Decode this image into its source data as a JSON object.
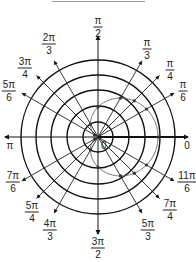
{
  "diagram": {
    "type": "polar-graph",
    "center": [
      98,
      137
    ],
    "ring_radii": [
      15,
      31,
      47,
      62,
      77
    ],
    "curve": {
      "kind": "cardioid",
      "equation_form": "r = a(1 + cos θ)",
      "a_px": 30,
      "color": "#555555"
    },
    "plotted_points_angles": [
      "0",
      "π/6",
      "π/4",
      "π/3",
      "π/2",
      "2π/3",
      "5π/6",
      "7π/6",
      "4π/3",
      "3π/2",
      "5π/3",
      "7π/4",
      "11π/6"
    ],
    "angle_labels": [
      {
        "id": "0",
        "text": "0",
        "x": 187,
        "y": 146
      },
      {
        "id": "pi6",
        "num": "π",
        "den": "6",
        "x": 183,
        "y": 91
      },
      {
        "id": "pi4",
        "num": "π",
        "den": "4",
        "x": 170,
        "y": 70
      },
      {
        "id": "pi3",
        "num": "π",
        "den": "3",
        "x": 147,
        "y": 49
      },
      {
        "id": "pi2",
        "num": "π",
        "den": "2",
        "x": 98,
        "y": 27
      },
      {
        "id": "2pi3",
        "num": "2π",
        "den": "3",
        "x": 49,
        "y": 44
      },
      {
        "id": "3pi4",
        "num": "3π",
        "den": "4",
        "x": 25,
        "y": 68
      },
      {
        "id": "5pi6",
        "num": "5π",
        "den": "6",
        "x": 9,
        "y": 91
      },
      {
        "id": "pi",
        "text": "π",
        "x": 10,
        "y": 146
      },
      {
        "id": "7pi6",
        "num": "7π",
        "den": "6",
        "x": 13,
        "y": 182
      },
      {
        "id": "5pi4",
        "num": "5π",
        "den": "4",
        "x": 32,
        "y": 212
      },
      {
        "id": "4pi3",
        "num": "4π",
        "den": "3",
        "x": 50,
        "y": 230
      },
      {
        "id": "3pi2",
        "num": "3π",
        "den": "2",
        "x": 98,
        "y": 248
      },
      {
        "id": "5pi3",
        "num": "5π",
        "den": "3",
        "x": 148,
        "y": 230
      },
      {
        "id": "7pi4",
        "num": "7π",
        "den": "4",
        "x": 170,
        "y": 210
      },
      {
        "id": "11pi6",
        "num": "11π",
        "den": "6",
        "x": 187,
        "y": 182
      }
    ],
    "origin_label": "0"
  }
}
